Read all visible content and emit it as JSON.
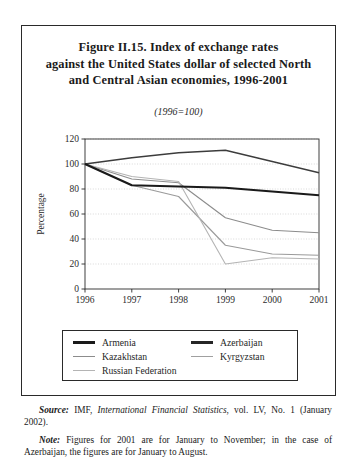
{
  "figure": {
    "title_lines": [
      "Figure II.15.  Index of exchange rates",
      "against the United States dollar of selected North",
      "and Central Asian economies, 1996-2001"
    ],
    "subtitle": "(1996=100)"
  },
  "chart_data": {
    "type": "line",
    "title": "Figure II.15.  Index of exchange rates against the United States dollar of selected North and Central Asian economies, 1996-2001",
    "subtitle": "(1996=100)",
    "xlabel": "",
    "ylabel": "Percentage",
    "categories": [
      "1996",
      "1997",
      "1998",
      "1999",
      "2000",
      "2001"
    ],
    "x": [
      1996,
      1997,
      1998,
      1999,
      2000,
      2001
    ],
    "xlim": [
      1996,
      2001
    ],
    "ylim": [
      0,
      120
    ],
    "yticks": [
      0,
      20,
      40,
      60,
      80,
      100,
      120
    ],
    "xticks": [
      "1996",
      "1997",
      "1998",
      "1999",
      "2000",
      "2001"
    ],
    "grid": true,
    "grid_axis": "y",
    "legend_position": "bottom",
    "series": [
      {
        "name": "Armenia",
        "color": "#1a1a1a",
        "width": 2.2,
        "values": [
          100,
          83,
          82,
          81,
          78,
          75
        ]
      },
      {
        "name": "Azerbaijan",
        "color": "#3c3c3c",
        "width": 1.3,
        "values": [
          100,
          105,
          109,
          111,
          102,
          93
        ]
      },
      {
        "name": "Kazakhstan",
        "color": "#8c8c8c",
        "width": 1.1,
        "values": [
          100,
          88,
          85,
          57,
          47,
          45
        ]
      },
      {
        "name": "Kyrgyzstan",
        "color": "#9a9a9a",
        "width": 1.1,
        "values": [
          100,
          83,
          74,
          35,
          28,
          27
        ]
      },
      {
        "name": "Russian Federation",
        "color": "#b4b4b4",
        "width": 1.1,
        "values": [
          100,
          90,
          86,
          20,
          25,
          24
        ]
      }
    ]
  },
  "legend": {
    "entries": [
      {
        "label": "Armenia",
        "color": "#1a1a1a",
        "thickness": "2.6px"
      },
      {
        "label": "Azerbaijan",
        "color": "#262626",
        "thickness": "2.6px"
      },
      {
        "label": "Kazakhstan",
        "color": "#8c8c8c",
        "thickness": "1.6px"
      },
      {
        "label": "Kyrgyzstan",
        "color": "#a0a0a0",
        "thickness": "1.6px"
      },
      {
        "label": "Russian Federation",
        "color": "#b4b4b4",
        "thickness": "1.6px"
      }
    ]
  },
  "footnotes": {
    "source_lead": "Source:",
    "source_part1": "  IMF, ",
    "source_italic": "International Financial Statistics",
    "source_part2": ", vol. LV, No. 1 (January 2002).",
    "note_lead": "Note:",
    "note_text": "  Figures for 2001 are for January to November; in the case of Azerbaijan, the figures are for January to August."
  }
}
